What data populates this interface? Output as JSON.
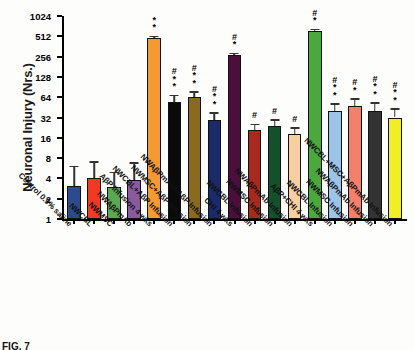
{
  "figure": {
    "caption": "FIG. 7",
    "ylabel": "Neuronal Injury (Nrs.)"
  },
  "chart_data": {
    "type": "bar",
    "title": "",
    "xlabel": "",
    "ylabel": "Neuronal Injury (Nrs.)",
    "yscale": "log2",
    "ylim": [
      1,
      1024
    ],
    "yticks": [
      1,
      2,
      4,
      8,
      16,
      32,
      64,
      128,
      256,
      512,
      1024
    ],
    "ytick_labels": [
      "1",
      "2",
      "4",
      "8",
      "16",
      "32",
      "64",
      "128",
      "256",
      "512",
      "1024"
    ],
    "grid": false,
    "legend": "none",
    "categories": [
      "Control 0.9% saline",
      "NWCBL",
      "NWMSC",
      "NWAβPmAb",
      "AβP Infusion 4 wks",
      "NWCBL+AβP Infusion",
      "NWMSC+AβP Infusion",
      "NWAβPmAb+AβP Infusion",
      "CHI 4 wks",
      "NWCBL Infusion",
      "NWMSC Infusion",
      "NWAβPmAb Infusion",
      "AβP+CHI 4 wks",
      "NWCBL Infusion",
      "NWMSC Infusion",
      "NWAβPmAb Infusion",
      "NWCBL+MSC+AβPmAb Infusion"
    ],
    "values": [
      3.1,
      4.0,
      3.0,
      3.8,
      480,
      55,
      64,
      29,
      270,
      21,
      24,
      18,
      620,
      40,
      48,
      40,
      32
    ],
    "errors_upper": [
      6.2,
      7.2,
      5.0,
      7.0,
      520,
      70,
      78,
      38,
      290,
      26,
      30,
      23,
      660,
      52,
      62,
      54,
      44
    ],
    "colors": [
      "#2e4a8f",
      "#ef3b21",
      "#5aa84f",
      "#8a5a9e",
      "#f59a32",
      "#0a0a0a",
      "#8a6a1e",
      "#1b2a6b",
      "#4a0f3c",
      "#a82a1e",
      "#13502c",
      "#f7cfa0",
      "#4aa83c",
      "#9cc3e8",
      "#f2806a",
      "#333333",
      "#f2ee26"
    ],
    "annotations": [
      "",
      "",
      "",
      "",
      "*\n*",
      "#\n*\n*",
      "#\n*\n*",
      "#\n*\n*",
      "#\n*",
      "#",
      "#",
      "#",
      "#\n*",
      "#\n*\n*",
      "#\n*",
      "#\n*\n*",
      "#\n*\n*"
    ]
  }
}
